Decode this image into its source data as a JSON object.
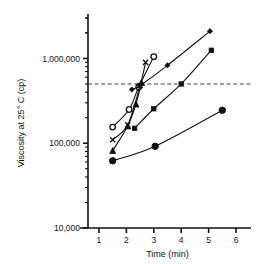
{
  "chart_data": {
    "type": "line",
    "title": "",
    "xlabel": "Time (min)",
    "ylabel": "Viscosity at 25° C (cp)",
    "xlim": [
      0.6,
      6.4
    ],
    "ylim": [
      10000,
      3000000
    ],
    "yscale": "log",
    "xscale": "linear",
    "grid": false,
    "legend": "none",
    "xticks": [
      1,
      2,
      3,
      4,
      5,
      6
    ],
    "xtick_labels": [
      "1",
      "2",
      "3",
      "4",
      "5",
      "6"
    ],
    "yticks": [
      10000,
      100000,
      1000000
    ],
    "ytick_labels": [
      "10,000",
      "100,000",
      "1,000,000"
    ],
    "reference_line": {
      "orientation": "horizontal",
      "value": 500000,
      "style": "dashed",
      "color": "#444444"
    },
    "series": [
      {
        "name": "series-open-circle",
        "marker": "open-circle",
        "points": [
          {
            "x": 1.5,
            "y": 155000
          },
          {
            "x": 2.1,
            "y": 250000
          },
          {
            "x": 2.45,
            "y": 460000
          },
          {
            "x": 3.0,
            "y": 1050000
          }
        ]
      },
      {
        "name": "series-cross",
        "marker": "cross",
        "points": [
          {
            "x": 1.5,
            "y": 110000
          },
          {
            "x": 2.05,
            "y": 165000
          },
          {
            "x": 2.5,
            "y": 480000
          },
          {
            "x": 2.7,
            "y": 900000
          }
        ]
      },
      {
        "name": "series-filled-triangle",
        "marker": "filled-triangle",
        "points": [
          {
            "x": 1.5,
            "y": 82000
          },
          {
            "x": 2.05,
            "y": 160000
          },
          {
            "x": 2.35,
            "y": 290000
          },
          {
            "x": 2.55,
            "y": 520000
          }
        ]
      },
      {
        "name": "series-filled-diamond-upper",
        "marker": "filled-diamond",
        "points": [
          {
            "x": 2.2,
            "y": 430000
          },
          {
            "x": 2.5,
            "y": 480000
          },
          {
            "x": 3.5,
            "y": 830000
          },
          {
            "x": 5.05,
            "y": 2100000
          }
        ]
      },
      {
        "name": "series-small-square",
        "marker": "small-square",
        "points": [
          {
            "x": 2.3,
            "y": 150000
          },
          {
            "x": 3.0,
            "y": 255000
          },
          {
            "x": 4.0,
            "y": 500000
          },
          {
            "x": 5.1,
            "y": 1250000
          }
        ]
      },
      {
        "name": "series-filled-circle-lower",
        "marker": "filled-circle",
        "points": [
          {
            "x": 1.5,
            "y": 62000
          },
          {
            "x": 3.05,
            "y": 92000
          },
          {
            "x": 5.5,
            "y": 245000
          }
        ]
      }
    ]
  }
}
